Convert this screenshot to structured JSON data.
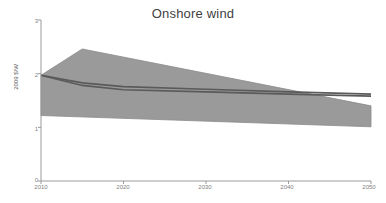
{
  "chart_data": {
    "type": "area",
    "title": "Onshore wind",
    "xlabel": "",
    "ylabel": "2009 $/W",
    "xlim": [
      2010,
      2050
    ],
    "ylim": [
      0,
      3
    ],
    "grid": false,
    "legend": false,
    "x_ticks": [
      "2010",
      "2020",
      "2030",
      "2040",
      "2050"
    ],
    "x_tick_values": [
      2010,
      2020,
      2030,
      2040,
      2050
    ],
    "y_ticks": [
      "0",
      "1",
      "2",
      "3"
    ],
    "y_tick_values": [
      0,
      1,
      2,
      3
    ],
    "series": [
      {
        "name": "upper bound",
        "role": "band-upper",
        "x": [
          2010,
          2015,
          2050
        ],
        "values": [
          1.97,
          2.46,
          1.4
        ]
      },
      {
        "name": "lower bound",
        "role": "band-lower",
        "x": [
          2010,
          2050
        ],
        "values": [
          1.22,
          1.01
        ]
      },
      {
        "name": "central projection high",
        "role": "line",
        "x": [
          2010,
          2015,
          2020,
          2030,
          2040,
          2050
        ],
        "values": [
          1.97,
          1.83,
          1.76,
          1.71,
          1.66,
          1.62
        ]
      },
      {
        "name": "central projection low",
        "role": "line",
        "x": [
          2010,
          2015,
          2020,
          2030,
          2040,
          2050
        ],
        "values": [
          1.97,
          1.78,
          1.7,
          1.66,
          1.62,
          1.58
        ]
      }
    ],
    "colors": {
      "band_fill": "#9a9a9a",
      "band_edge": "#8a8a8a",
      "line": "#5a5a5a",
      "axis": "#9a9a9a",
      "title_text": "#3f3f3f",
      "tick_text": "#808080"
    }
  },
  "axes": {
    "y_label": "2009 $/W"
  }
}
